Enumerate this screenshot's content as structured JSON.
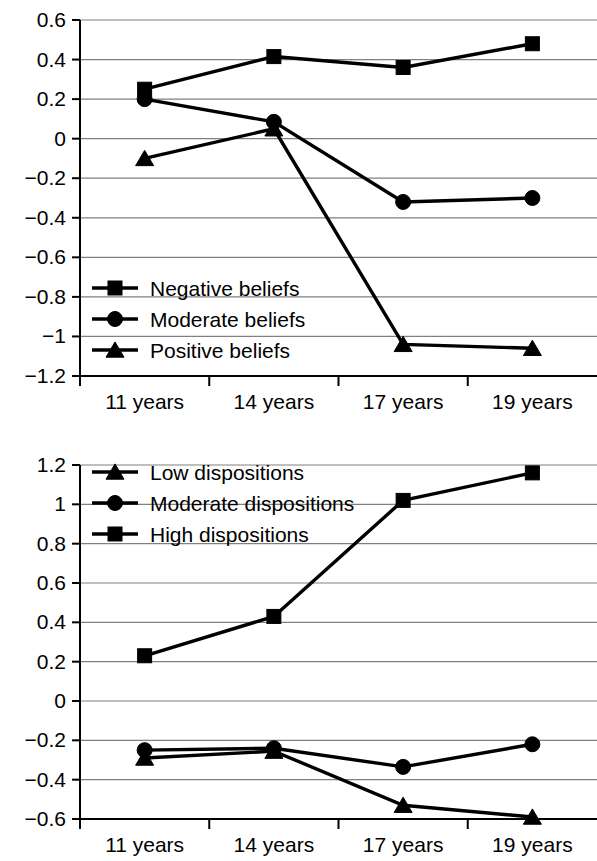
{
  "colors": {
    "ink": "#000000",
    "grid": "#808080",
    "background": "#ffffff"
  },
  "charts": [
    {
      "id": "beliefs-chart",
      "name": "beliefs-over-age-line-chart",
      "categories": [
        "11 years",
        "14 years",
        "17 years",
        "19 years"
      ],
      "y_ticks": [
        "0.6",
        "0.4",
        "0.2",
        "0",
        "−0.2",
        "−0.4",
        "−0.6",
        "−0.8",
        "−1",
        "−1.2"
      ],
      "legend": [
        {
          "label": "Negative beliefs",
          "marker": "square"
        },
        {
          "label": "Moderate beliefs",
          "marker": "circle"
        },
        {
          "label": "Positive beliefs",
          "marker": "triangle"
        }
      ]
    },
    {
      "id": "dispositions-chart",
      "name": "dispositions-over-age-line-chart",
      "categories": [
        "11 years",
        "14 years",
        "17 years",
        "19 years"
      ],
      "y_ticks": [
        "1.2",
        "1",
        "0.8",
        "0.6",
        "0.4",
        "0.2",
        "0",
        "−0.2",
        "−0.4",
        "−0.6"
      ],
      "legend": [
        {
          "label": "Low dispositions",
          "marker": "triangle"
        },
        {
          "label": "Moderate dispositions",
          "marker": "circle"
        },
        {
          "label": "High dispositions",
          "marker": "square"
        }
      ]
    }
  ],
  "chart_data": [
    {
      "type": "line",
      "title": "",
      "subtitle": "",
      "xlabel": "",
      "ylabel": "",
      "categories": [
        "11 years",
        "14 years",
        "17 years",
        "19 years"
      ],
      "x": [
        11,
        14,
        17,
        19
      ],
      "ylim": [
        -1.2,
        0.6
      ],
      "ytick_values": [
        0.6,
        0.4,
        0.2,
        0,
        -0.2,
        -0.4,
        -0.6,
        -0.8,
        -1,
        -1.2
      ],
      "grid": true,
      "legend_position": "inside-lower-left",
      "series": [
        {
          "name": "Negative beliefs",
          "marker": "square",
          "values": [
            0.25,
            0.415,
            0.36,
            0.48
          ]
        },
        {
          "name": "Moderate beliefs",
          "marker": "circle",
          "values": [
            0.2,
            0.085,
            -0.32,
            -0.3
          ]
        },
        {
          "name": "Positive beliefs",
          "marker": "triangle",
          "values": [
            -0.1,
            0.05,
            -1.04,
            -1.06
          ]
        }
      ]
    },
    {
      "type": "line",
      "title": "",
      "subtitle": "",
      "xlabel": "",
      "ylabel": "",
      "categories": [
        "11 years",
        "14 years",
        "17 years",
        "19 years"
      ],
      "x": [
        11,
        14,
        17,
        19
      ],
      "ylim": [
        -0.6,
        1.2
      ],
      "ytick_values": [
        1.2,
        1,
        0.8,
        0.6,
        0.4,
        0.2,
        0,
        -0.2,
        -0.4,
        -0.6
      ],
      "grid": true,
      "legend_position": "inside-upper-left",
      "series": [
        {
          "name": "Low dispositions",
          "marker": "triangle",
          "values": [
            -0.29,
            -0.255,
            -0.53,
            -0.59
          ]
        },
        {
          "name": "Moderate dispositions",
          "marker": "circle",
          "values": [
            -0.25,
            -0.24,
            -0.335,
            -0.22
          ]
        },
        {
          "name": "High dispositions",
          "marker": "square",
          "values": [
            0.23,
            0.43,
            1.02,
            1.16
          ]
        }
      ]
    }
  ]
}
